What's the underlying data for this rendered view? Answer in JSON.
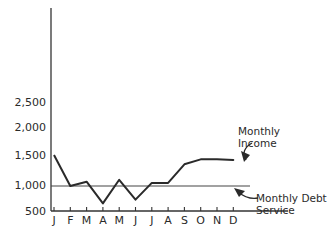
{
  "chart_data": {
    "type": "line",
    "title": "",
    "xlabel": "",
    "ylabel": "",
    "categories": [
      "J",
      "F",
      "M",
      "A",
      "M",
      "J",
      "J",
      "A",
      "S",
      "O",
      "N",
      "D"
    ],
    "y_tick_labels": [
      "2,500",
      "2,000",
      "1,500",
      "1,000",
      "500"
    ],
    "ylim": [
      500,
      2500
    ],
    "grid": false,
    "series": [
      {
        "name": "Monthly Income",
        "values": [
          1500,
          1000,
          1070,
          720,
          1100,
          780,
          1050,
          1050,
          1350,
          1430,
          1430,
          1420
        ]
      },
      {
        "name": "Monthly Debt Service",
        "values": [
          1000,
          1000,
          1000,
          1000,
          1000,
          1000,
          1000,
          1000,
          1000,
          1000,
          1000,
          1000
        ]
      }
    ],
    "annotations": [
      {
        "text": "Monthly Income",
        "target": "Monthly Income"
      },
      {
        "text": "Monthly Debt Service",
        "target": "Monthly Debt Service"
      }
    ]
  },
  "labels": {
    "income_line1": "Monthly",
    "income_line2": "Income",
    "debt_line1": "Monthly Debt",
    "debt_line2": "Service"
  },
  "colors": {
    "ink": "#2a2a2a"
  }
}
